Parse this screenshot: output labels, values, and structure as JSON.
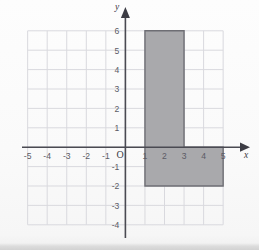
{
  "figure": {
    "title": "",
    "background_color": "#fbfbfb"
  },
  "axis_labels": {
    "x_axis_name": "x",
    "y_axis_name": "y",
    "origin_label": "O"
  },
  "x_ticks": [
    "-5",
    "-4",
    "-3",
    "-2",
    "-1",
    "1",
    "2",
    "3",
    "4",
    "5"
  ],
  "y_ticks": [
    "6",
    "5",
    "4",
    "3",
    "2",
    "1",
    "-1",
    "-2",
    "-3",
    "-4"
  ],
  "colors": {
    "grid_line": "#d9d9de",
    "axis_line": "#4a4a52",
    "shape_fill": "#a9a9ac",
    "shape_stroke": "#6e6e74"
  },
  "chart_data": {
    "type": "scatter",
    "title": "",
    "xlabel": "x",
    "ylabel": "y",
    "xlim": [
      -5,
      5
    ],
    "ylim": [
      -4,
      6
    ],
    "xticks": [
      -5,
      -4,
      -3,
      -2,
      -1,
      1,
      2,
      3,
      4,
      5
    ],
    "yticks": [
      6,
      5,
      4,
      3,
      2,
      1,
      -1,
      -2,
      -3,
      -4
    ],
    "grid": true,
    "legend": null,
    "shapes": [
      {
        "name": "l-shaped-polygon",
        "kind": "polygon",
        "fill": "#a9a9ac",
        "stroke": "#6e6e74",
        "vertices": [
          [
            1,
            6
          ],
          [
            3,
            6
          ],
          [
            3,
            0
          ],
          [
            5,
            0
          ],
          [
            5,
            -2
          ],
          [
            1,
            -2
          ]
        ]
      }
    ]
  }
}
